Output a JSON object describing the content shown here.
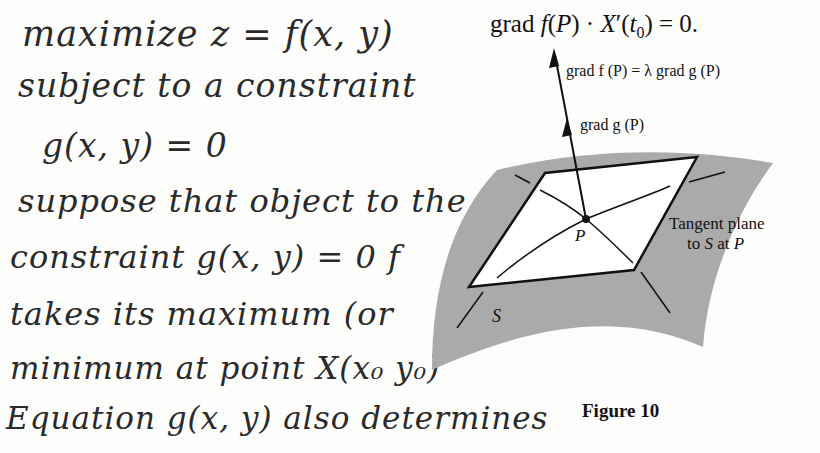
{
  "notes": {
    "lines": [
      "maximize z = f(x, y)",
      "subject to a constraint",
      "g(x, y) = 0",
      "suppose that object to the",
      "constraint g(x, y) = 0  f",
      "takes its maximum (or",
      "minimum at point X(x₀ y₀)",
      "Equation g(x, y) also determines"
    ]
  },
  "figure": {
    "equation_prefix": "grad ",
    "equation_f": "f",
    "equation_mid1": "(",
    "equation_P": "P",
    "equation_mid2": ") · ",
    "equation_X": "X",
    "equation_rest": "′(",
    "equation_t": "t",
    "equation_sub": "0",
    "equation_end": ") = 0.",
    "label_grad_f": "grad f (P) = λ grad g (P)",
    "label_grad_g": "grad g (P)",
    "label_point": "P",
    "label_surface": "S",
    "tangent_line1": "Tangent plane",
    "tangent_line2_a": "to ",
    "tangent_line2_S": "S",
    "tangent_line2_b": " at ",
    "tangent_line2_P": "P",
    "caption": "Figure 10",
    "colors": {
      "surface": "#a9a9a9",
      "plane": "#ffffff",
      "ink": "#111111"
    }
  }
}
